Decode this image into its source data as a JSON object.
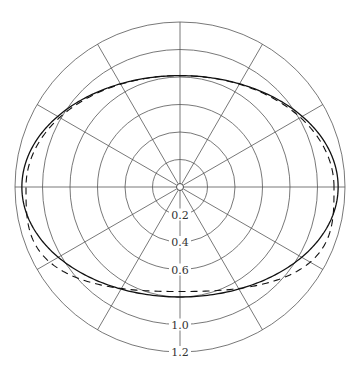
{
  "chart_data": {
    "type": "polar",
    "title": "",
    "radial_ticks": [
      "0.2",
      "0.4",
      "0.6",
      "0.8",
      "1.0",
      "1.2"
    ],
    "radial_tick_labels_shown": [
      "0.2",
      "0.4",
      "0.6",
      "1.0",
      "1.2"
    ],
    "rmax": 1.2,
    "angular_gridlines_deg": [
      0,
      30,
      60,
      90,
      120,
      150,
      180,
      210,
      240,
      270,
      300,
      330
    ],
    "series": [
      {
        "name": "solid",
        "style": "solid",
        "shape": "ellipse",
        "semi_axis_x": 1.15,
        "semi_axis_y_top": 0.81,
        "semi_axis_y_bottom": 0.8
      },
      {
        "name": "dashed",
        "style": "dashed",
        "shape": "flattened ellipse",
        "semi_axis_x": 1.12,
        "semi_axis_y_top": 0.81,
        "semi_axis_y_bottom": 0.76
      }
    ],
    "colors": {
      "grid": "#555555",
      "curve": "#111111"
    }
  }
}
